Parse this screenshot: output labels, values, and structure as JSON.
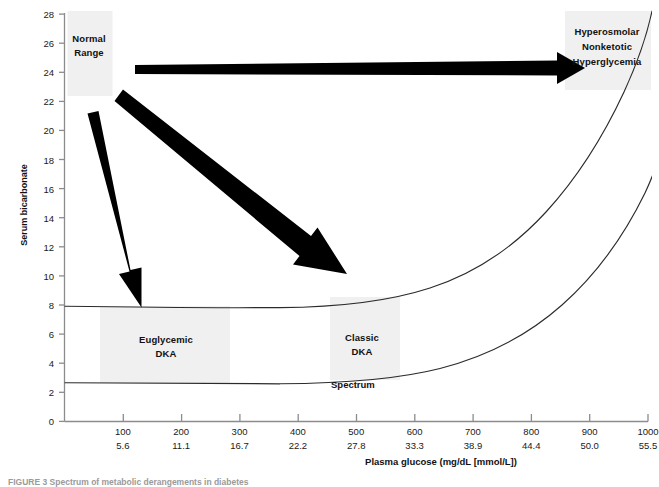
{
  "figure": {
    "caption": "FIGURE 3  Spectrum of metabolic derangements in diabetes"
  },
  "axes": {
    "y_title": "Serum bicarbonate",
    "x_title": "Plasma glucose (mg/dL [mmol/L])"
  },
  "zones": {
    "normal_range": "Normal\nRange",
    "normal_range_line1": "Normal",
    "normal_range_line2": "Range",
    "hyperosmolar_line1": "Hyperosmolar",
    "hyperosmolar_line2": "Nonketotic",
    "hyperosmolar_line3": "Hyperglycemia",
    "euglycemic_line1": "Euglycemic",
    "euglycemic_line2": "DKA",
    "classic_line1": "Classic",
    "classic_line2": "DKA",
    "spectrum": "Spectrum"
  },
  "colors": {
    "zone_fill": "#f0f0f0",
    "curve": "#2b2b2b",
    "axis": "#8c8c8c",
    "arrow": "#000000",
    "text": "#1a1a1a"
  },
  "chart_data": {
    "type": "line",
    "title": "",
    "xlabel": "Plasma glucose (mg/dL [mmol/L])",
    "ylabel": "Serum bicarbonate",
    "xlim": [
      0,
      1000
    ],
    "ylim": [
      0,
      28
    ],
    "grid": false,
    "legend_position": "none",
    "x_ticks_mgdl": [
      100,
      200,
      300,
      400,
      500,
      600,
      700,
      800,
      900,
      1000
    ],
    "x_ticks_mmol": [
      "5.6",
      "11.1",
      "16.7",
      "22.2",
      "27.8",
      "33.3",
      "38.9",
      "44.4",
      "50.0",
      "55.5"
    ],
    "y_ticks": [
      0,
      2,
      4,
      6,
      8,
      10,
      12,
      14,
      16,
      18,
      20,
      22,
      24,
      26,
      28
    ],
    "series": [
      {
        "name": "Upper spectrum boundary",
        "x": [
          20,
          100,
          200,
          300,
          400,
          500,
          600,
          700,
          775,
          840,
          890,
          930,
          960,
          985
        ],
        "values": [
          7.85,
          7.8,
          7.75,
          7.75,
          8.2,
          9.3,
          11.2,
          14.0,
          16.8,
          20.0,
          23.0,
          25.5,
          27.0,
          28.0
        ]
      },
      {
        "name": "Lower spectrum boundary",
        "x": [
          20,
          100,
          200,
          300,
          400,
          500,
          600,
          700,
          800,
          880,
          940,
          985,
          1000
        ],
        "values": [
          2.65,
          2.6,
          2.55,
          2.55,
          2.75,
          3.3,
          4.4,
          6.2,
          8.9,
          12.2,
          15.6,
          19.0,
          20.4
        ]
      }
    ],
    "annotations": [
      {
        "text": "Normal Range",
        "x_range": [
          30,
          200
        ],
        "y_range": [
          21.2,
          28.0
        ]
      },
      {
        "text": "Euglycemic DKA",
        "x_range": [
          105,
          395
        ],
        "y_range": [
          2.6,
          7.8
        ]
      },
      {
        "text": "Classic DKA",
        "x_range": [
          565,
          690
        ],
        "y_range": [
          3.6,
          9.5
        ]
      },
      {
        "text": "Hyperosmolar Nonketotic Hyperglycemia",
        "x_range": [
          880,
          1000
        ],
        "y_range": [
          21.8,
          28.0
        ]
      },
      {
        "text": "Spectrum",
        "x": 560,
        "y": 1.9
      }
    ],
    "arrows": [
      {
        "from": [
          180,
          24.5
        ],
        "to": [
          960,
          25.0
        ],
        "label": "to hyperosmolar nonketotic hyperglycemia"
      },
      {
        "from": [
          150,
          22.4
        ],
        "to": [
          500,
          10.3
        ],
        "label": "to classic DKA"
      },
      {
        "from": [
          90,
          21.3
        ],
        "to": [
          145,
          8.0
        ],
        "label": "to euglycemic DKA"
      }
    ]
  }
}
